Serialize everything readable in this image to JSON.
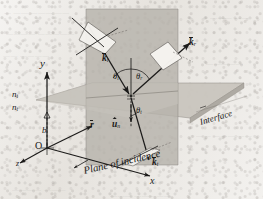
{
  "figure": {
    "kind": "optics-reflection-refraction-3d-diagram",
    "caption_text": "Plane of incidence",
    "interface_label": "Interface"
  },
  "axes": {
    "x_label": "x",
    "y_label": "y",
    "z_label": "z",
    "origin_label": "O",
    "height_label": "b"
  },
  "media": {
    "incident_index": "n",
    "incident_index_sub": "i",
    "transmitted_index": "n",
    "transmitted_index_sub": "t"
  },
  "angles": [
    {
      "name": "incidence-angle",
      "symbol": "θ",
      "sub": "i"
    },
    {
      "name": "reflection-angle",
      "symbol": "θ",
      "sub": "r"
    },
    {
      "name": "transmission-angle",
      "symbol": "θ",
      "sub": "t"
    }
  ],
  "vectors": [
    {
      "name": "incident-wave-vector",
      "symbol": "k",
      "sub": "i",
      "style": "bold-overbar"
    },
    {
      "name": "reflected-wave-vector",
      "symbol": "k",
      "sub": "r",
      "style": "bold-overbar"
    },
    {
      "name": "transmitted-wave-vector",
      "symbol": "k",
      "sub": "t",
      "style": "bold-overbar"
    },
    {
      "name": "position-vector",
      "symbol": "r",
      "sub": "",
      "style": "bold-overbar"
    },
    {
      "name": "surface-normal-unit-vector",
      "symbol": "u",
      "sub": "n",
      "style": "bold-hat"
    }
  ],
  "colors": {
    "paper": "#e9e6e1",
    "ink": "#1b1a19",
    "incidence_plane_fill": "#b9b5ae",
    "interface_plane_fill": "#cbc7c0",
    "polarization_patch_fill": "#f3f1ec",
    "shadow_gray": "#a5a19a"
  },
  "ghost_marks": [
    {
      "text": "—  ——   ———   ——",
      "x": 4,
      "y": 9,
      "size": 7
    },
    {
      "text": "————   —————",
      "x": 6,
      "y": 30,
      "size": 7
    },
    {
      "text": "——  ————",
      "x": 3,
      "y": 52,
      "size": 7
    },
    {
      "text": "———   ——",
      "x": 210,
      "y": 14,
      "size": 7
    },
    {
      "text": "—————",
      "x": 206,
      "y": 60,
      "size": 7
    },
    {
      "text": "——  ———  ——",
      "x": 196,
      "y": 132,
      "size": 7
    },
    {
      "text": "————   ———",
      "x": 12,
      "y": 186,
      "size": 7
    },
    {
      "text": "———  —————",
      "x": 110,
      "y": 192,
      "size": 7
    }
  ]
}
